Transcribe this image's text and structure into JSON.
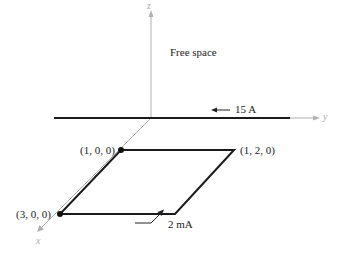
{
  "diagram": {
    "region_label": "Free space",
    "axes": {
      "x": "x",
      "y": "y",
      "z": "z"
    },
    "wire": {
      "current": "15 A",
      "direction": "-y"
    },
    "loop": {
      "current": "2 mA",
      "corners": [
        "(1, 0, 0)",
        "(1, 2, 0)",
        "(3, 0, 0)"
      ]
    },
    "colors": {
      "conductor": "#1a1a1a",
      "axis": "#b0b0b0",
      "text": "#222222"
    }
  }
}
